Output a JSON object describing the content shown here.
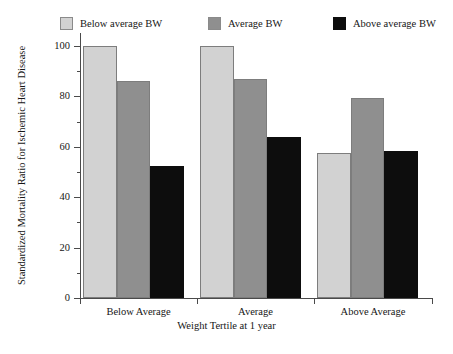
{
  "chart_data": {
    "type": "bar",
    "title": "",
    "xlabel": "Weight Tertile at 1 year",
    "ylabel": "Standardized Mortality Ratio for Ischemic Heart Disease",
    "categories": [
      "Below Average",
      "Average",
      "Above Average"
    ],
    "series": [
      {
        "name": "Below average BW",
        "color": "#d2d2d2",
        "values": [
          100,
          100,
          57.5
        ]
      },
      {
        "name": "Average BW",
        "color": "#8f8f8f",
        "values": [
          86,
          87,
          79.5
        ]
      },
      {
        "name": "Above average BW",
        "color": "#0d0d0d",
        "values": [
          52.5,
          64,
          58.5
        ]
      }
    ],
    "ylim": [
      0,
      105
    ],
    "y_major_ticks": [
      0,
      20,
      40,
      60,
      80,
      100
    ],
    "y_tick_labels": [
      "0",
      "20",
      "40",
      "60",
      "80",
      "100"
    ],
    "y_minor_ticks": [
      10,
      30,
      50,
      70,
      90
    ],
    "grid": false,
    "legend_position": "top"
  },
  "legend": {
    "items": [
      {
        "label": "Below average BW"
      },
      {
        "label": "Average BW"
      },
      {
        "label": "Above average BW"
      }
    ]
  },
  "axes": {
    "y_title": "Standardized Mortality Ratio for Ischemic Heart Disease",
    "x_title": "Weight Tertile at 1 year",
    "y_labels": {
      "t0": "0",
      "t20": "20",
      "t40": "40",
      "t60": "60",
      "t80": "80",
      "t100": "100"
    },
    "x_labels": {
      "c0": "Below Average",
      "c1": "Average",
      "c2": "Above Average"
    }
  }
}
